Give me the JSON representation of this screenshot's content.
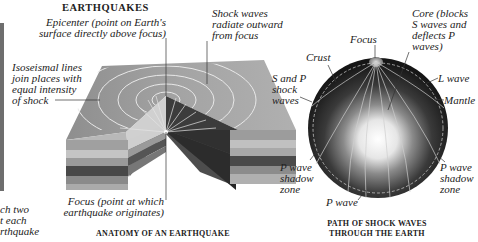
{
  "title": "EARTHQUAKES",
  "left_fragment": {
    "lines": [
      "ch two",
      "t each",
      "rthquake"
    ]
  },
  "anatomy": {
    "caption": "ANATOMY OF AN EARTHQUAKE",
    "labels": {
      "epicenter": [
        "Epicenter (point on Earth's",
        "surface directly above focus)"
      ],
      "shock_waves": [
        "Shock waves",
        "radiate outward",
        "from focus"
      ],
      "isoseismal": [
        "Isoseismal lines",
        "join places with",
        "equal intensity",
        "of shock"
      ],
      "focus": [
        "Focus (point at which",
        "earthquake originates)"
      ]
    }
  },
  "globe": {
    "caption": [
      "PATH OF SHOCK WAVES",
      "THROUGH THE EARTH"
    ],
    "labels": {
      "focus": "Focus",
      "core": [
        "Core (blocks",
        "S waves and",
        "deflects P",
        "waves)"
      ],
      "crust": "Crust",
      "s_and_p": [
        "S and P",
        "shock",
        "waves"
      ],
      "l_wave": "L wave",
      "mantle": "Mantle",
      "p_shadow_left": [
        "P wave",
        "shadow",
        "zone"
      ],
      "p_shadow_right": [
        "P wave",
        "shadow",
        "zone"
      ],
      "p_wave": "P wave"
    }
  },
  "colors": {
    "crust_top": "#a8a8a8",
    "layer_light": "#c8c8c8",
    "layer_mid": "#8a8a8a",
    "layer_dark": "#3a3a3a",
    "globe_dark": "#1e1e1e",
    "core_light": "#f4f4f4"
  }
}
